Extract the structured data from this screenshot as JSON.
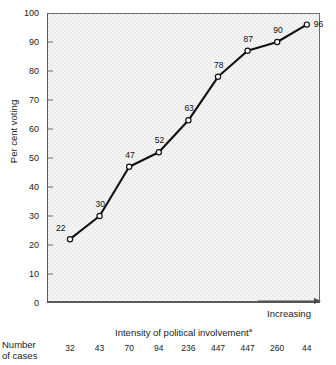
{
  "figure": {
    "y_axis_title": "Per cent voting",
    "x_axis_title": "Intensity of political involvement",
    "x_axis_title_footnote": "a",
    "increasing_label": "Increasing",
    "cases_caption_line1": "Number",
    "cases_caption_line2": "of cases",
    "plot_bg_color": "#eaeaea",
    "line_color": "#111111",
    "marker_fill": "#ffffff",
    "marker_stroke": "#111111"
  },
  "chart_data": {
    "type": "line",
    "title": "",
    "subtitle": "",
    "xlabel": "Intensity of political involvement",
    "ylabel": "Per cent voting",
    "categories": [
      "1",
      "2",
      "3",
      "4",
      "5",
      "6",
      "7",
      "8",
      "9"
    ],
    "values": [
      22,
      30,
      47,
      52,
      63,
      78,
      87,
      90,
      96
    ],
    "point_labels": [
      "22",
      "30",
      "47",
      "52",
      "63",
      "78",
      "87",
      "90",
      "96"
    ],
    "number_of_cases": [
      32,
      43,
      70,
      94,
      236,
      447,
      447,
      260,
      44
    ],
    "number_of_cases_labels": [
      "32",
      "43",
      "70",
      "94",
      "236",
      "447",
      "447",
      "260",
      "44"
    ],
    "ylim": [
      0,
      100
    ],
    "yticks": [
      0,
      10,
      20,
      30,
      40,
      50,
      60,
      70,
      80,
      90,
      100
    ],
    "ytick_labels": [
      "0",
      "10",
      "20",
      "30",
      "40",
      "50",
      "60",
      "70",
      "80",
      "90",
      "100"
    ],
    "xlim": [
      0,
      10
    ],
    "xticks": [],
    "xtick_labels": [],
    "grid": false,
    "legend": "none",
    "annotations": [
      "Increasing"
    ],
    "markers": "open-circle",
    "footnote_marker": "a"
  }
}
